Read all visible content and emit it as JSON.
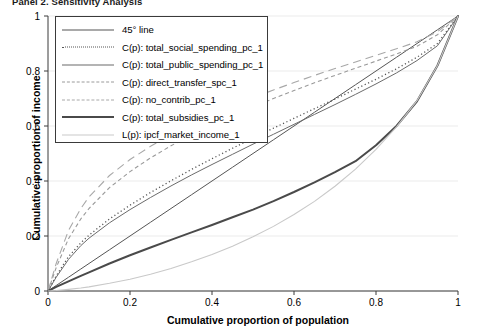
{
  "panel": {
    "title": "Panel 2. Sensitivity Analysis"
  },
  "axes": {
    "xlabel": "Cumulative proportion of population",
    "ylabel": "Cumulative proportion of income",
    "xticks": [
      "0",
      "0.2",
      "0.4",
      "0.6",
      "0.8",
      "1"
    ],
    "yticks": [
      "0",
      "0.2",
      "0.4",
      "0.6",
      "0.8",
      "1"
    ]
  },
  "legend": {
    "items": [
      {
        "label": "45° line",
        "style": "solid",
        "color": "#555555",
        "width": 1.0
      },
      {
        "label": "C(p): total_social_spending_pc_1",
        "style": "dotted",
        "color": "#555555",
        "width": 1.3
      },
      {
        "label": "C(p): total_public_spending_pc_1",
        "style": "solid",
        "color": "#6b6b6b",
        "width": 1.0
      },
      {
        "label": "C(p): direct_transfer_spc_1",
        "style": "dash-short",
        "color": "#9a9a9a",
        "width": 1.1
      },
      {
        "label": "C(p): no_contrib_pc_1",
        "style": "dash-long",
        "color": "#a8a8a8",
        "width": 1.1
      },
      {
        "label": "C(p): total_subsidies_pc_1",
        "style": "solid",
        "color": "#4a4a4a",
        "width": 2.0
      },
      {
        "label": "L(p): ipcf_market_income_1",
        "style": "solid",
        "color": "#c9c9c9",
        "width": 1.1
      }
    ]
  },
  "chart_data": {
    "type": "line",
    "title": "Panel 2. Sensitivity Analysis",
    "xlabel": "Cumulative proportion of population",
    "ylabel": "Cumulative proportion of income",
    "xlim": [
      0,
      1
    ],
    "ylim": [
      0,
      1
    ],
    "grid": true,
    "legend_position": "upper-left-inside",
    "x": [
      0,
      0.02,
      0.05,
      0.08,
      0.1,
      0.15,
      0.2,
      0.25,
      0.3,
      0.35,
      0.4,
      0.45,
      0.5,
      0.55,
      0.6,
      0.65,
      0.7,
      0.75,
      0.8,
      0.85,
      0.9,
      0.95,
      1
    ],
    "series": [
      {
        "name": "45° line",
        "style": "solid",
        "color": "#555555",
        "width": 1.0,
        "values": [
          0,
          0.02,
          0.05,
          0.08,
          0.1,
          0.15,
          0.2,
          0.25,
          0.3,
          0.35,
          0.4,
          0.45,
          0.5,
          0.55,
          0.6,
          0.65,
          0.7,
          0.75,
          0.8,
          0.85,
          0.9,
          0.95,
          1
        ]
      },
      {
        "name": "C(p): total_social_spending_pc_1",
        "style": "dotted",
        "color": "#555555",
        "width": 1.3,
        "values": [
          0,
          0.055,
          0.125,
          0.175,
          0.203,
          0.262,
          0.312,
          0.358,
          0.401,
          0.442,
          0.481,
          0.519,
          0.556,
          0.592,
          0.628,
          0.663,
          0.698,
          0.734,
          0.77,
          0.808,
          0.85,
          0.9,
          1
        ]
      },
      {
        "name": "C(p): total_public_spending_pc_1",
        "style": "solid",
        "color": "#6b6b6b",
        "width": 1.0,
        "values": [
          0,
          0.05,
          0.115,
          0.165,
          0.192,
          0.248,
          0.296,
          0.34,
          0.382,
          0.422,
          0.46,
          0.497,
          0.534,
          0.57,
          0.606,
          0.642,
          0.678,
          0.715,
          0.753,
          0.793,
          0.838,
          0.892,
          1
        ]
      },
      {
        "name": "C(p): direct_transfer_spc_1",
        "style": "dash-short",
        "color": "#9a9a9a",
        "width": 1.1,
        "values": [
          0,
          0.085,
          0.19,
          0.262,
          0.3,
          0.376,
          0.434,
          0.484,
          0.528,
          0.568,
          0.604,
          0.638,
          0.67,
          0.7,
          0.729,
          0.757,
          0.784,
          0.81,
          0.836,
          0.862,
          0.89,
          0.932,
          1
        ]
      },
      {
        "name": "C(p): no_contrib_pc_1",
        "style": "dash-long",
        "color": "#a8a8a8",
        "width": 1.1,
        "values": [
          0,
          0.1,
          0.22,
          0.3,
          0.342,
          0.42,
          0.478,
          0.526,
          0.568,
          0.606,
          0.641,
          0.673,
          0.703,
          0.731,
          0.758,
          0.784,
          0.809,
          0.833,
          0.857,
          0.881,
          0.906,
          0.943,
          1
        ]
      },
      {
        "name": "C(p): total_subsidies_pc_1",
        "style": "solid",
        "color": "#4a4a4a",
        "width": 2.0,
        "values": [
          0,
          0.015,
          0.035,
          0.055,
          0.068,
          0.1,
          0.13,
          0.158,
          0.186,
          0.213,
          0.24,
          0.268,
          0.296,
          0.327,
          0.36,
          0.395,
          0.432,
          0.472,
          0.53,
          0.6,
          0.69,
          0.82,
          1
        ]
      },
      {
        "name": "L(p): ipcf_market_income_1",
        "style": "solid",
        "color": "#c9c9c9",
        "width": 1.1,
        "values": [
          0,
          0.002,
          0.006,
          0.011,
          0.015,
          0.028,
          0.043,
          0.061,
          0.082,
          0.106,
          0.133,
          0.163,
          0.197,
          0.235,
          0.278,
          0.326,
          0.381,
          0.443,
          0.515,
          0.597,
          0.692,
          0.82,
          1
        ]
      }
    ]
  }
}
